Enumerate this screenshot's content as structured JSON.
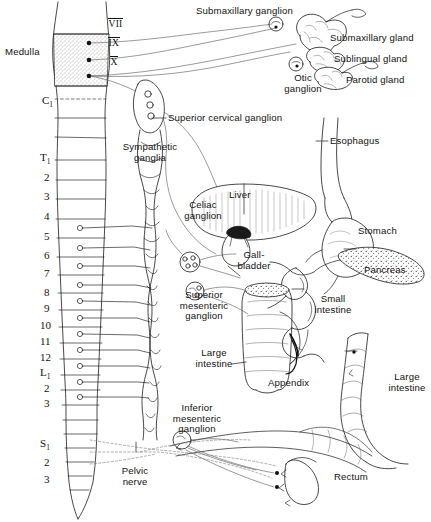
{
  "figure": {
    "width": 431,
    "height": 522,
    "ink_color": "#111111",
    "paper_color": "#ffffff"
  },
  "cns": {
    "medulla_label": "Medulla",
    "cranial_nerves": [
      "VII",
      "IX",
      "X"
    ],
    "spinal_segments": [
      {
        "id": "c1",
        "label": "C",
        "sub": "1",
        "x": 42,
        "y": 95
      },
      {
        "id": "t1",
        "label": "T",
        "sub": "1",
        "x": 40,
        "y": 152
      },
      {
        "id": "t2",
        "label": "2",
        "sub": "",
        "x": 44,
        "y": 172
      },
      {
        "id": "t3",
        "label": "3",
        "sub": "",
        "x": 44,
        "y": 191
      },
      {
        "id": "t4",
        "label": "4",
        "sub": "",
        "x": 44,
        "y": 211
      },
      {
        "id": "t5",
        "label": "5",
        "sub": "",
        "x": 44,
        "y": 231
      },
      {
        "id": "t6",
        "label": "6",
        "sub": "",
        "x": 44,
        "y": 250
      },
      {
        "id": "t7",
        "label": "7",
        "sub": "",
        "x": 44,
        "y": 268
      },
      {
        "id": "t8",
        "label": "8",
        "sub": "",
        "x": 44,
        "y": 287
      },
      {
        "id": "t9",
        "label": "9",
        "sub": "",
        "x": 44,
        "y": 303
      },
      {
        "id": "t10",
        "label": "10",
        "sub": "",
        "x": 40,
        "y": 320
      },
      {
        "id": "t11",
        "label": "11",
        "sub": "",
        "x": 40,
        "y": 336
      },
      {
        "id": "t12",
        "label": "12",
        "sub": "",
        "x": 40,
        "y": 352
      },
      {
        "id": "l1",
        "label": "L",
        "sub": "1",
        "x": 40,
        "y": 367
      },
      {
        "id": "l2",
        "label": "2",
        "sub": "",
        "x": 44,
        "y": 383
      },
      {
        "id": "l3",
        "label": "3",
        "sub": "",
        "x": 44,
        "y": 398
      },
      {
        "id": "s1",
        "label": "S",
        "sub": "1",
        "x": 40,
        "y": 438
      },
      {
        "id": "s2",
        "label": "2",
        "sub": "",
        "x": 44,
        "y": 457
      },
      {
        "id": "s3",
        "label": "3",
        "sub": "",
        "x": 44,
        "y": 474
      }
    ]
  },
  "ganglia": {
    "submaxillary": "Submaxillary ganglion",
    "otic": "Otic\nganglion",
    "superior_cervical": "Superior cervical ganglion",
    "sympathetic_chain": "Sympathetic\nganglia",
    "celiac": "Celiac\nganglion",
    "superior_mesenteric": "Superior\nmesenteric\nganglion",
    "inferior_mesenteric": "Inferior\nmesenteric\nganglion"
  },
  "organs": {
    "submaxillary_gland": "Submaxillary gland",
    "sublingual_gland": "Sublingual gland",
    "parotid_gland": "Parotid gland",
    "esophagus": "Esophagus",
    "stomach": "Stomach",
    "liver": "Liver",
    "gallbladder": "Gall-\nbladder",
    "pancreas": "Pancreas",
    "small_intestine": "Small\nintestine",
    "large_intestine_left": "Large\nintestine",
    "large_intestine_right": "Large\nintestine",
    "appendix": "Appendix",
    "rectum": "Rectum"
  },
  "nerves": {
    "pelvic": "Pelvic\nnerve"
  }
}
